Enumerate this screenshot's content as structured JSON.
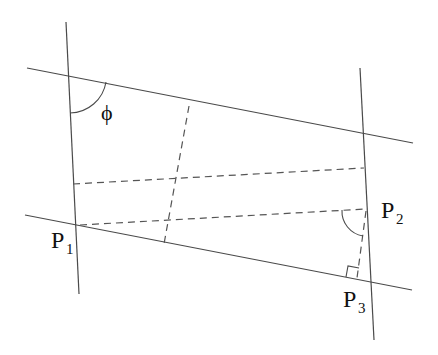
{
  "diagram": {
    "type": "geometry",
    "colors": {
      "line": "#4a4a4a",
      "dash": "#555555",
      "text": "#111111",
      "background": "#ffffff"
    },
    "labels": {
      "phi": "ϕ",
      "p1_main": "P",
      "p1_sub": "1",
      "p2_main": "P",
      "p2_sub": "2",
      "p3_main": "P",
      "p3_sub": "3"
    },
    "solid_lines": [
      {
        "name": "left-vertical",
        "x1": 66,
        "y1": 22,
        "x2": 79,
        "y2": 294
      },
      {
        "name": "right-vertical",
        "x1": 360,
        "y1": 68,
        "x2": 374,
        "y2": 340
      },
      {
        "name": "top-line",
        "x1": 27,
        "y1": 68,
        "x2": 413,
        "y2": 143
      },
      {
        "name": "bottom-line",
        "x1": 25,
        "y1": 215,
        "x2": 412,
        "y2": 290
      }
    ],
    "dashed_lines": [
      {
        "name": "mid-horizontal",
        "x1": 73,
        "y1": 184,
        "x2": 364,
        "y2": 168
      },
      {
        "name": "p1-p2",
        "x1": 78,
        "y1": 225,
        "x2": 366,
        "y2": 209
      },
      {
        "name": "mid-slanted",
        "x1": 189,
        "y1": 106,
        "x2": 164,
        "y2": 244
      },
      {
        "name": "p2-p3",
        "x1": 366,
        "y1": 210,
        "x2": 357,
        "y2": 279
      }
    ],
    "points": {
      "P1": {
        "x": 77,
        "y": 225
      },
      "P2": {
        "x": 366,
        "y": 209
      },
      "P3": {
        "x": 371,
        "y": 281
      }
    }
  }
}
